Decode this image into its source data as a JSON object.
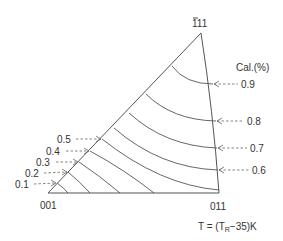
{
  "diagram": {
    "type": "stereographic-triangle-contour",
    "corners": {
      "bottom_left": "001",
      "bottom_right": "011",
      "apex": "111",
      "apex_bar": "-"
    },
    "legend_title": "Cal.(%)",
    "formula": {
      "prefix": "T = (T",
      "subscript": "R",
      "suffix": "−35)K"
    },
    "left_labels": [
      "0.1",
      "0.2",
      "0.3",
      "0.4",
      "0.5"
    ],
    "right_labels": [
      "0.9",
      "0.8",
      "0.7",
      "0.6"
    ],
    "contours": [
      {
        "value": "0.1",
        "from": [
          57,
          183
        ],
        "to": [
          68,
          193
        ]
      },
      {
        "value": "0.2",
        "from": [
          68,
          172
        ],
        "to": [
          90,
          193
        ]
      },
      {
        "value": "0.3",
        "from": [
          79,
          162
        ],
        "to": [
          120,
          193
        ]
      },
      {
        "value": "0.4",
        "from": [
          90,
          151
        ],
        "to": [
          154,
          193
        ]
      },
      {
        "value": "0.5",
        "from": [
          102,
          139
        ],
        "to": [
          219,
          190
        ]
      },
      {
        "value": "0.6",
        "from": [
          114,
          128
        ],
        "to": [
          218,
          170
        ]
      },
      {
        "value": "0.7",
        "from": [
          129,
          113
        ],
        "to": [
          217,
          148
        ]
      },
      {
        "value": "0.8",
        "from": [
          146,
          94
        ],
        "to": [
          216,
          121
        ]
      },
      {
        "value": "0.9",
        "from": [
          172,
          66
        ],
        "to": [
          213,
          84
        ]
      }
    ],
    "colors": {
      "line": "#555555",
      "text": "#333333",
      "background": "#ffffff"
    }
  }
}
